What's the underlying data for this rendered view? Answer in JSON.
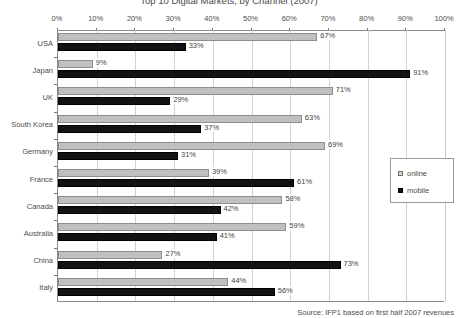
{
  "chart_data": {
    "type": "bar",
    "orientation": "horizontal",
    "title": "Top 10 Digital Markets, by Channel (2007)",
    "xlabel": "",
    "ylabel": "",
    "xlim": [
      0,
      100
    ],
    "xticks": [
      "0%",
      "10%",
      "20%",
      "30%",
      "40%",
      "50%",
      "60%",
      "70%",
      "80%",
      "90%",
      "100%"
    ],
    "xtick_values": [
      0,
      10,
      20,
      30,
      40,
      50,
      60,
      70,
      80,
      90,
      100
    ],
    "grid": true,
    "legend_position": "right",
    "categories": [
      "USA",
      "Japan",
      "UK",
      "South Korea",
      "Germany",
      "France",
      "Canada",
      "Australia",
      "China",
      "Italy"
    ],
    "series": [
      {
        "name": "online",
        "color": "#c0c0c0",
        "values": [
          67,
          9,
          71,
          63,
          69,
          39,
          58,
          59,
          27,
          44
        ],
        "labels": [
          "67%",
          "9%",
          "71%",
          "63%",
          "69%",
          "39%",
          "58%",
          "59%",
          "27%",
          "44%"
        ]
      },
      {
        "name": "mobile",
        "color": "#121212",
        "values": [
          33,
          91,
          29,
          37,
          31,
          61,
          42,
          41,
          73,
          56
        ],
        "labels": [
          "33%",
          "91%",
          "29%",
          "37%",
          "31%",
          "61%",
          "42%",
          "41%",
          "73%",
          "56%"
        ]
      }
    ],
    "annotations": [
      "Source: IFP1 based on first half 2007 revenues"
    ]
  },
  "legend": {
    "items": [
      {
        "label": "online",
        "swatch": "online-swatch-icon"
      },
      {
        "label": "mobile",
        "swatch": "mobile-swatch-icon"
      }
    ]
  },
  "source_note": "Source: IFP1 based on first half 2007 revenues"
}
